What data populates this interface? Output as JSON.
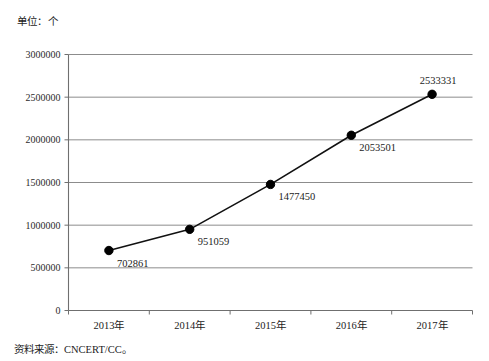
{
  "unit_label": "单位：个",
  "source_note": "资料来源：CNCERT/CC。",
  "chart_data": {
    "type": "line",
    "title": "",
    "subtitle": "",
    "xlabel": "",
    "ylabel": "",
    "unit": "单位：个",
    "categories": [
      "2013年",
      "2014年",
      "2015年",
      "2016年",
      "2017年"
    ],
    "values": [
      702861,
      951059,
      1477450,
      2053501,
      2533331
    ],
    "point_labels": [
      "702861",
      "951059",
      "1477450",
      "2053501",
      "2533331"
    ],
    "ylim": [
      0,
      3000000
    ],
    "ytick_values": [
      0,
      500000,
      1000000,
      1500000,
      2000000,
      2500000,
      3000000
    ],
    "ytick_labels": [
      "0",
      "500000",
      "1000000",
      "1500000",
      "2000000",
      "2500000",
      "3000000"
    ],
    "grid": true,
    "grid_axis": "y",
    "legend": false,
    "legend_position": "none",
    "series": [
      {
        "name": "",
        "values": [
          702861,
          951059,
          1477450,
          2053501,
          2533331
        ],
        "color": "#000000",
        "marker": "circle"
      }
    ],
    "source": "CNCERT/CC"
  },
  "colors": {
    "line": "#111111",
    "marker": "#000000",
    "grid": "#8c8c8c",
    "axis": "#6f6f6f",
    "text": "#1c1c1c",
    "background": "#ffffff"
  }
}
